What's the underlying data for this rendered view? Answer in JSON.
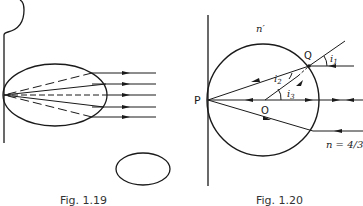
{
  "figures": [
    {
      "id": "fig-1-19",
      "caption": "Fig. 1.19",
      "description": "Eye-like ellipse against a vertical surface; parallel horizontal rays enter from the right and converge to a point on the left wall (solid and dashed rays), with a small separate ellipse below."
    },
    {
      "id": "fig-1-20",
      "caption": "Fig. 1.20",
      "labels": {
        "point_p": "P",
        "point_q": "Q",
        "center_o": "O",
        "inner_index": "n′",
        "outer_index": "n = 4/3",
        "angle_1": "i",
        "angle_1_sub": "1",
        "angle_2": "i",
        "angle_2_sub": "2",
        "angle_3": "i",
        "angle_3_sub": "3"
      },
      "description": "Sphere of index n′ touching a vertical wall at P, in a medium of index n = 4/3. A ray enters at Q with incidence angle i1, refracts at angle i2 toward P; i3 is the angle at center O between the axis and OQ."
    }
  ],
  "colors": {
    "ink": "#1a1a1a",
    "background": "#ffffff"
  }
}
